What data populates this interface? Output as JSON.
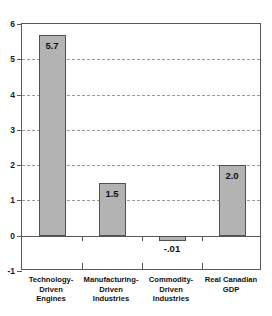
{
  "chart_data": {
    "type": "bar",
    "title": "",
    "subtitle": "",
    "xlabel": "",
    "ylabel": "",
    "ylim": [
      -1,
      6
    ],
    "grid": true,
    "legend": false,
    "categories": [
      "Technology-\nDriven\nEngines",
      "Manufacturing-\nDriven\nIndustries",
      "Commodity-\nDriven\nIndustries",
      "Real Canadian\nGDP"
    ],
    "values": [
      5.7,
      1.5,
      -0.01,
      2.0
    ],
    "value_labels": [
      "5.7",
      "1.5",
      "-.01",
      "2.0"
    ],
    "ytick_labels": [
      "6",
      "5",
      "4",
      "3",
      "2",
      "1",
      "0",
      "-1"
    ],
    "ytick_values": [
      6,
      5,
      4,
      3,
      2,
      1,
      0,
      -1
    ],
    "colors": {
      "bar_fill": "#b3b3b3",
      "bar_border": "#4e5255",
      "gridline": "#9a9a9a",
      "axis": "#555a5e",
      "text": "#111111",
      "background": "#ffffff"
    }
  }
}
